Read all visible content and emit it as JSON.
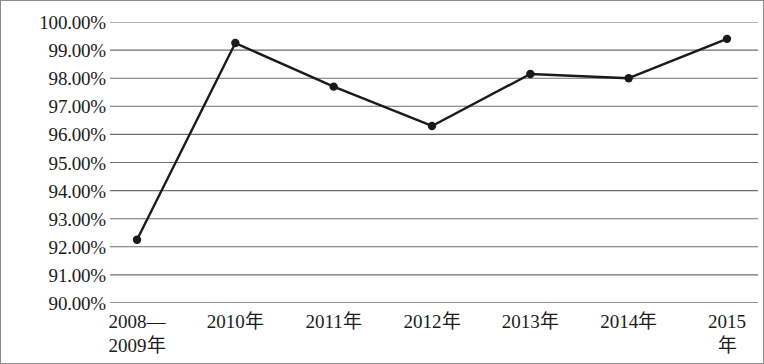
{
  "chart_data": {
    "type": "line",
    "title": "",
    "subtitle": "",
    "xlabel": "",
    "ylabel": "",
    "categories": [
      "2008—\n2009年",
      "2010年",
      "2011年",
      "2012年",
      "2013年",
      "2014年",
      "2015年"
    ],
    "values": [
      92.25,
      99.25,
      97.7,
      96.3,
      98.15,
      98.0,
      99.4
    ],
    "series": [
      {
        "name": "",
        "values": [
          92.25,
          99.25,
          97.7,
          96.3,
          98.15,
          98.0,
          99.4
        ]
      }
    ],
    "ylim": [
      90,
      100
    ],
    "ytick_step": 1,
    "ytick_labels": [
      "100.00%",
      "99.00%",
      "98.00%",
      "97.00%",
      "96.00%",
      "95.00%",
      "94.00%",
      "93.00%",
      "92.00%",
      "91.00%",
      "90.00%"
    ],
    "ytick_values": [
      100,
      99,
      98,
      97,
      96,
      95,
      94,
      93,
      92,
      91,
      90
    ],
    "grid": {
      "horizontal": true,
      "vertical": false
    },
    "legend": {
      "visible": false,
      "position": "none"
    },
    "marker": "circle",
    "line_color": "#1a1a1a",
    "marker_color": "#1a1a1a",
    "grid_color": "#6e6e6e",
    "border_color": "#8a8a8a",
    "background_color": "#ffffff"
  }
}
